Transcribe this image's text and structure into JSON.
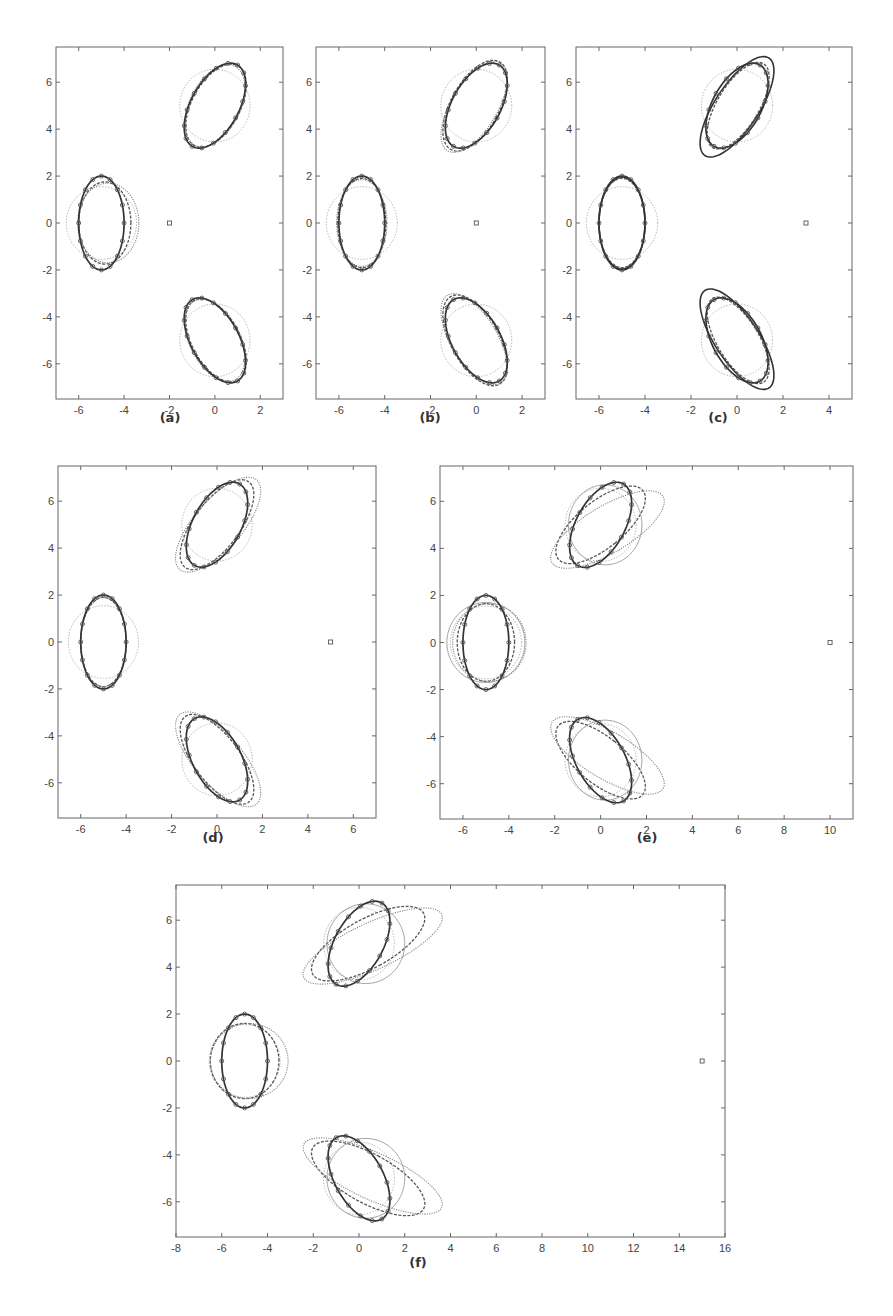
{
  "figure": {
    "captions": [
      "(a)",
      "(b)",
      "(c)",
      "(d)",
      "(e)",
      "(f)"
    ]
  },
  "colors": {
    "axis": "#666666",
    "true_ellipse": "#333333",
    "estimate_dashed": "#555555",
    "estimate_dotted": "#888888",
    "prior_circle": "#bbbbbb",
    "marker": "#555555"
  },
  "chart_data": [
    {
      "type": "scatter",
      "title": "(a)",
      "xlim": [
        -7,
        3
      ],
      "ylim": [
        -7.5,
        7.5
      ],
      "xticks": [
        -6,
        -4,
        -2,
        0,
        2
      ],
      "yticks": [
        -6,
        -4,
        -2,
        0,
        2,
        4,
        6
      ],
      "box": [
        56,
        47,
        283,
        399
      ],
      "observer": [
        -2,
        0
      ],
      "estimates": [
        {
          "style": "dashed",
          "ellipses": [
            [
              -4.85,
              0,
              1.15,
              1.75,
              0
            ],
            [
              0.05,
              5.0,
              1.05,
              1.95,
              -30
            ],
            [
              0.05,
              -5.0,
              1.05,
              1.95,
              30
            ]
          ]
        },
        {
          "style": "dotted",
          "ellipses": [
            [
              -4.7,
              0,
              1.35,
              1.7,
              0
            ],
            [
              0.0,
              5.0,
              1.1,
              1.9,
              -28
            ],
            [
              0.0,
              -5.0,
              1.1,
              1.9,
              28
            ]
          ]
        }
      ],
      "caption_pos": [
        170,
        410
      ]
    },
    {
      "type": "scatter",
      "title": "(b)",
      "xlim": [
        -7,
        3
      ],
      "ylim": [
        -7.5,
        7.5
      ],
      "xticks": [
        -6,
        -4,
        -2,
        0,
        2
      ],
      "yticks": [
        -6,
        -4,
        -2,
        0,
        2,
        4,
        6
      ],
      "box": [
        316,
        47,
        545,
        399
      ],
      "observer": [
        0,
        0
      ],
      "estimates": [
        {
          "style": "dashed",
          "ellipses": [
            [
              -5.0,
              0,
              1.05,
              1.9,
              0
            ],
            [
              -0.05,
              5.0,
              1.05,
              2.15,
              -30
            ],
            [
              -0.05,
              -5.0,
              1.05,
              2.15,
              30
            ]
          ]
        },
        {
          "style": "dotted",
          "ellipses": [
            [
              -5.0,
              0,
              1.1,
              1.85,
              0
            ],
            [
              -0.1,
              4.95,
              1.0,
              2.2,
              -32
            ],
            [
              -0.1,
              -4.95,
              1.0,
              2.2,
              32
            ]
          ]
        }
      ],
      "caption_pos": [
        430,
        410
      ]
    },
    {
      "type": "scatter",
      "title": "(c)",
      "xlim": [
        -7,
        5
      ],
      "ylim": [
        -7.5,
        7.5
      ],
      "xticks": [
        -6,
        -4,
        -2,
        0,
        2,
        4
      ],
      "yticks": [
        -6,
        -4,
        -2,
        0,
        2,
        4,
        6
      ],
      "box": [
        576,
        47,
        852,
        399
      ],
      "observer": [
        3,
        0
      ],
      "estimates": [
        {
          "style": "solid",
          "ellipses": [
            [
              -5.0,
              0,
              1.0,
              1.95,
              0
            ],
            [
              0.0,
              4.95,
              0.95,
              2.5,
              -34
            ],
            [
              0.0,
              -4.95,
              0.95,
              2.5,
              34
            ]
          ]
        },
        {
          "style": "dashed",
          "ellipses": [
            [
              -5.0,
              0,
              1.0,
              1.9,
              0
            ],
            [
              0.05,
              5.0,
              0.9,
              2.1,
              -32
            ],
            [
              0.05,
              -5.0,
              0.9,
              2.1,
              32
            ]
          ]
        }
      ],
      "caption_pos": [
        718,
        410
      ]
    },
    {
      "type": "scatter",
      "title": "(d)",
      "xlim": [
        -7,
        7
      ],
      "ylim": [
        -7.5,
        7.5
      ],
      "xticks": [
        -6,
        -4,
        -2,
        0,
        2,
        4,
        6
      ],
      "yticks": [
        -6,
        -4,
        -2,
        0,
        2,
        4,
        6
      ],
      "box": [
        58,
        466,
        376,
        818
      ],
      "observer": [
        5,
        0
      ],
      "estimates": [
        {
          "style": "dashed",
          "ellipses": [
            [
              -5.0,
              0,
              1.0,
              1.9,
              0
            ],
            [
              0.0,
              5.0,
              1.0,
              2.3,
              -38
            ],
            [
              0.0,
              -5.0,
              1.0,
              2.3,
              38
            ]
          ]
        },
        {
          "style": "dotted",
          "ellipses": [
            [
              -5.0,
              0,
              1.0,
              1.9,
              0
            ],
            [
              0.05,
              5.0,
              1.05,
              2.55,
              -42
            ],
            [
              0.05,
              -5.0,
              1.05,
              2.55,
              42
            ]
          ]
        }
      ],
      "caption_pos": [
        213,
        830
      ]
    },
    {
      "type": "scatter",
      "title": "(e)",
      "xlim": [
        -7,
        11
      ],
      "ylim": [
        -7.5,
        7.5
      ],
      "xticks": [
        -6,
        -4,
        -2,
        0,
        2,
        4,
        6,
        8,
        10
      ],
      "yticks": [
        -6,
        -4,
        -2,
        0,
        2,
        4,
        6
      ],
      "box": [
        440,
        466,
        853,
        819
      ],
      "observer": [
        10,
        0
      ],
      "estimates": [
        {
          "style": "dashed",
          "ellipses": [
            [
              -5.0,
              0,
              1.25,
              1.65,
              0
            ],
            [
              0.0,
              5.0,
              1.0,
              2.35,
              -52
            ],
            [
              0.0,
              -5.0,
              1.0,
              2.35,
              52
            ]
          ]
        },
        {
          "style": "dotted",
          "ellipses": [
            [
              -4.85,
              0,
              1.6,
              1.65,
              0
            ],
            [
              0.3,
              4.8,
              1.0,
              2.8,
              -60
            ],
            [
              0.3,
              -4.8,
              1.0,
              2.8,
              60
            ]
          ]
        },
        {
          "style": "thin",
          "ellipses": [
            [
              -5.0,
              0,
              1.7,
              1.7,
              0
            ],
            [
              0.2,
              5.0,
              1.6,
              1.7,
              0
            ],
            [
              0.2,
              -5.0,
              1.6,
              1.7,
              0
            ]
          ]
        }
      ],
      "caption_pos": [
        647,
        830
      ]
    },
    {
      "type": "scatter",
      "title": "(f)",
      "xlim": [
        -8,
        16
      ],
      "ylim": [
        -7.5,
        7.5
      ],
      "xticks": [
        -8,
        -6,
        -4,
        -2,
        0,
        2,
        4,
        6,
        8,
        10,
        12,
        14,
        16
      ],
      "yticks": [
        -6,
        -4,
        -2,
        0,
        2,
        4,
        6
      ],
      "box": [
        176,
        885,
        725,
        1237
      ],
      "observer": [
        15,
        0
      ],
      "estimates": [
        {
          "style": "dashed",
          "ellipses": [
            [
              -5.0,
              0,
              1.5,
              1.6,
              0
            ],
            [
              0.4,
              5.0,
              1.05,
              2.75,
              -62
            ],
            [
              0.4,
              -5.0,
              1.05,
              2.75,
              62
            ]
          ]
        },
        {
          "style": "dotted",
          "ellipses": [
            [
              -4.8,
              0,
              1.7,
              1.6,
              0
            ],
            [
              0.6,
              4.9,
              1.0,
              3.3,
              -66
            ],
            [
              0.6,
              -4.9,
              1.0,
              3.3,
              66
            ]
          ]
        },
        {
          "style": "thin",
          "ellipses": [
            [
              0.3,
              5.0,
              1.7,
              1.7,
              0
            ],
            [
              0.3,
              -5.0,
              1.7,
              1.7,
              0
            ]
          ]
        }
      ],
      "caption_pos": [
        418,
        1255
      ]
    }
  ],
  "true_targets": [
    {
      "cx": -5.0,
      "cy": 0.0,
      "a": 1.0,
      "b": 2.0,
      "angle_deg": 0
    },
    {
      "cx": 0.0,
      "cy": 5.0,
      "a": 1.05,
      "b": 2.0,
      "angle_deg": -30
    },
    {
      "cx": 0.0,
      "cy": -5.0,
      "a": 1.05,
      "b": 2.0,
      "angle_deg": 30
    }
  ],
  "prior_circles": [
    {
      "cx": -5.0,
      "cy": 0.0,
      "r": 1.55
    },
    {
      "cx": 0.0,
      "cy": 5.0,
      "r": 1.55
    },
    {
      "cx": 0.0,
      "cy": -5.0,
      "r": 1.55
    }
  ]
}
